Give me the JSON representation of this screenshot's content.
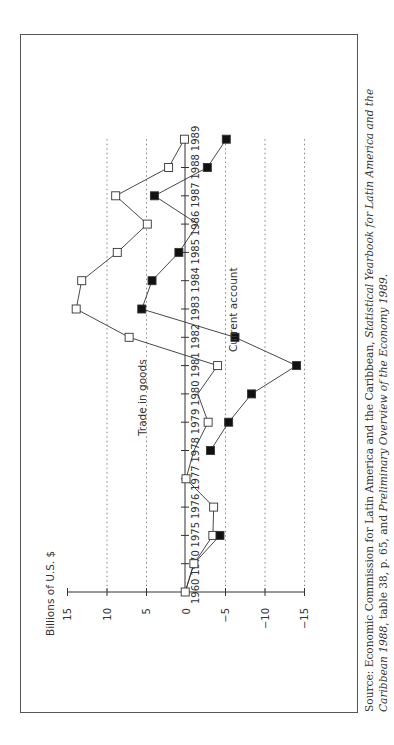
{
  "chart_data": {
    "type": "line",
    "orientation": "rotated-90-ccw",
    "title": "",
    "ylabel": "Billions of U.S. $",
    "xlabel": "",
    "ylim": [
      -15,
      15
    ],
    "yticks": [
      15,
      10,
      5,
      0,
      -5,
      -10,
      -15
    ],
    "ytick_labels": [
      "15",
      "10",
      "5",
      "0",
      "−5",
      "−10",
      "−15"
    ],
    "grid": "dotted at 10, 5, -5, -10, -15",
    "categories": [
      "1960",
      "1970",
      "1975",
      "1976",
      "1977",
      "1978",
      "1979",
      "1980",
      "1981",
      "1982",
      "1983",
      "1984",
      "1985",
      "1986",
      "1987",
      "1988",
      "1989"
    ],
    "series": [
      {
        "name": "Trade in goods",
        "marker": "open-square",
        "values": [
          0.1,
          -1.0,
          -3.4,
          -3.5,
          0.0,
          -1.0,
          -2.8,
          -1.5,
          -4.0,
          7.2,
          13.9,
          13.2,
          8.7,
          4.9,
          8.9,
          2.2,
          0.2
        ],
        "marker_hidden": [
          "1978",
          "1980"
        ]
      },
      {
        "name": "Current account",
        "marker": "filled-square",
        "values": [
          0.1,
          -1.0,
          -4.3,
          null,
          null,
          -3.1,
          -5.4,
          -8.3,
          -14.0,
          -6.2,
          5.6,
          4.3,
          0.9,
          -1.5,
          4.0,
          -2.7,
          -5.1
        ],
        "marker_hidden": [
          "1960",
          "1970",
          "1986"
        ]
      }
    ],
    "annotations": [
      "Trade in goods",
      "Current account"
    ]
  },
  "labels": {
    "ylabel": "Billions of U.S. $",
    "trade_label": "Trade in goods",
    "current_label": "Current account"
  },
  "source": {
    "prefix": "Source: Economic Commission for Latin America and the Caribbean, ",
    "italic1": "Statistical Yearbook for Latin America and the Caribbean 1988",
    "middle": ", table 38, p. 65, and ",
    "italic2": "Preliminary Overview of the Economy 1989",
    "suffix": "."
  }
}
